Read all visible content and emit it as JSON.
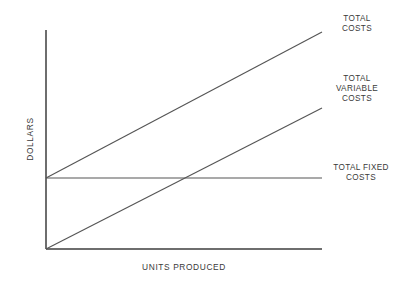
{
  "chart_data": {
    "type": "line",
    "title": "",
    "subtitle": "",
    "xlabel": "UNITS PRODUCED",
    "ylabel": "DOLLARS",
    "xlim": [
      0,
      100
    ],
    "ylim": [
      0,
      100
    ],
    "grid": false,
    "axis_ticks": false,
    "tick_labels_x": [],
    "tick_labels_y": [],
    "legend_position": "right-inline-annotations",
    "series": [
      {
        "name": "TOTAL COSTS",
        "label_text": "TOTAL\nCOSTS",
        "x": [
          0,
          100
        ],
        "y": [
          32.4,
          99.1
        ],
        "intercept": 32.4,
        "slope": 0.667,
        "color": "#555555"
      },
      {
        "name": "TOTAL VARIABLE COSTS",
        "label_text": "TOTAL\nVARIABLE\nCOSTS",
        "x": [
          0,
          100
        ],
        "y": [
          0,
          64.4
        ],
        "intercept": 0,
        "slope": 0.644,
        "color": "#555555"
      },
      {
        "name": "TOTAL FIXED COSTS",
        "label_text": "TOTAL FIXED\nCOSTS",
        "x": [
          0,
          100
        ],
        "y": [
          32.4,
          32.4
        ],
        "intercept": 32.4,
        "slope": 0,
        "color": "#555555"
      }
    ],
    "annotations": [
      {
        "name": "total-costs",
        "text": "TOTAL\nCOSTS"
      },
      {
        "name": "total-variable-costs",
        "text": "TOTAL\nVARIABLE\nCOSTS"
      },
      {
        "name": "total-fixed-costs",
        "text": "TOTAL FIXED\nCOSTS"
      }
    ],
    "colors": {
      "background": "#ffffff",
      "axis": "#6e6e6e",
      "line": "#555555",
      "text": "#3a3a3a"
    }
  },
  "geometry": {
    "origin_x": 46,
    "origin_y": 249,
    "axis_top_y": 30,
    "axis_right_x": 322,
    "fixed_cost_y": 178,
    "total_costs_right_y": 32,
    "variable_costs_right_y": 108
  }
}
